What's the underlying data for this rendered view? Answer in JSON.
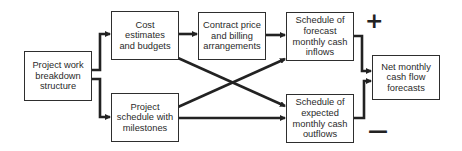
{
  "diagram": {
    "nodes": [
      {
        "id": "wbs",
        "label": "Project work\nbreakdown\nstructure"
      },
      {
        "id": "cost",
        "label": "Cost\nestimates\nand budgets"
      },
      {
        "id": "schedule",
        "label": "Project\nschedule with\nmilestones"
      },
      {
        "id": "contract",
        "label": "Contract price\nand billing\narrangements"
      },
      {
        "id": "inflows",
        "label": "Schedule of\nforecast\nmonthly cash\ninflows"
      },
      {
        "id": "outflows",
        "label": "Schedule of\nexpected\nmonthly cash\noutflows"
      },
      {
        "id": "net",
        "label": "Net monthly\ncash flow\nforecasts"
      }
    ],
    "edges": [
      {
        "from": "wbs",
        "to": "cost"
      },
      {
        "from": "wbs",
        "to": "schedule"
      },
      {
        "from": "cost",
        "to": "contract"
      },
      {
        "from": "cost",
        "to": "outflows"
      },
      {
        "from": "schedule",
        "to": "inflows"
      },
      {
        "from": "schedule",
        "to": "outflows"
      },
      {
        "from": "contract",
        "to": "inflows"
      },
      {
        "from": "inflows",
        "to": "net",
        "sign": "+"
      },
      {
        "from": "outflows",
        "to": "net",
        "sign": "−"
      }
    ],
    "signs": {
      "plus": "+",
      "minus": "—"
    },
    "colors": {
      "line": "#222222",
      "border": "#2e2e2e",
      "text": "#2a2a2a",
      "background": "#ffffff"
    }
  }
}
